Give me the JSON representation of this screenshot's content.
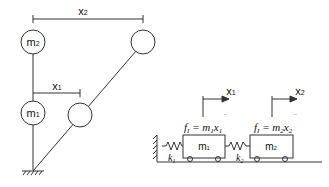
{
  "diagram": {
    "type": "structural dynamics model",
    "left_panel": {
      "title": "two-story frame / inverted pendulum",
      "mass_labels": [
        "m₂",
        "m₁"
      ],
      "displacement_labels": {
        "x1": "x₁",
        "x2": "x₂"
      }
    },
    "right_panel": {
      "title": "equivalent spring-mass system",
      "masses": [
        "m₁",
        "m₂"
      ],
      "springs": [
        "k₁",
        "k₂"
      ],
      "displacement_labels": [
        "x₁",
        "x₂"
      ],
      "equations": [
        "fı = m₁ẍ₁",
        "fı = m₂ẍ₂"
      ]
    },
    "colors": {
      "stroke": "#333333",
      "background": "#ffffff"
    }
  }
}
